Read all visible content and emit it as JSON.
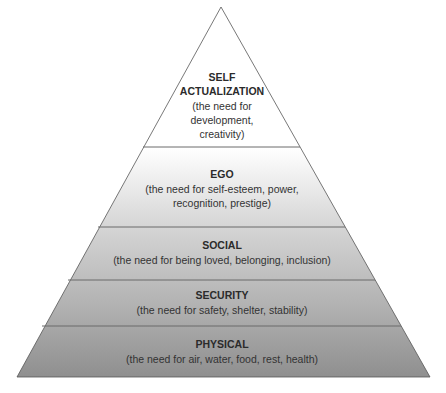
{
  "diagram": {
    "type": "pyramid",
    "colors": {
      "top": "#ffffff",
      "bottom": "#8f8f8f",
      "outline": "#555555",
      "divider": "#6b6b6b"
    },
    "levels": [
      {
        "title_lines": [
          "SELF",
          "ACTUALIZATION"
        ],
        "desc_lines": [
          "(the need for",
          "development,",
          "creativity)"
        ]
      },
      {
        "title_lines": [
          "EGO"
        ],
        "desc_lines": [
          "(the need for self-esteem, power,",
          "recognition, prestige)"
        ]
      },
      {
        "title_lines": [
          "SOCIAL"
        ],
        "desc_lines": [
          "(the need for being loved, belonging, inclusion)"
        ]
      },
      {
        "title_lines": [
          "SECURITY"
        ],
        "desc_lines": [
          "(the need for safety, shelter, stability)"
        ]
      },
      {
        "title_lines": [
          "PHYSICAL"
        ],
        "desc_lines": [
          "(the need for air, water, food, rest, health)"
        ]
      }
    ]
  }
}
